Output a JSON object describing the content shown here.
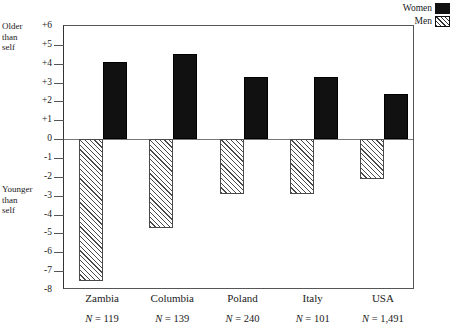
{
  "legend": {
    "items": [
      {
        "label": "Women",
        "style": "solid",
        "color": "#111111",
        "icon": "solid-swatch-icon"
      },
      {
        "label": "Men",
        "style": "hatch",
        "color": "#4a4a4a",
        "icon": "hatched-swatch-icon"
      }
    ]
  },
  "axis_captions": {
    "top": "Older\nthan\nself",
    "top_lines": [
      "Older",
      "than",
      "self"
    ],
    "bottom_lines": [
      "Younger",
      "than",
      "self"
    ]
  },
  "chart_data": {
    "type": "bar",
    "title": "",
    "xlabel": "",
    "ylabel": "",
    "ylim": [
      -8,
      6
    ],
    "grid": false,
    "legend_position": "top-right",
    "categories": [
      "Zambia",
      "Columbia",
      "Poland",
      "Italy",
      "USA"
    ],
    "sample_sizes": [
      "N = 119",
      "N = 139",
      "N = 240",
      "N = 101",
      "N = 1,491"
    ],
    "ytick_labels": [
      "+6",
      "+5",
      "+4",
      "+3",
      "+2",
      "+1",
      "0",
      "-1",
      "-2",
      "-3",
      "-4",
      "-5",
      "-6",
      "-7",
      "-8"
    ],
    "ytick_values": [
      6,
      5,
      4,
      3,
      2,
      1,
      0,
      -1,
      -2,
      -3,
      -4,
      -5,
      -6,
      -7,
      -8
    ],
    "series": [
      {
        "name": "Women",
        "values": [
          4.1,
          4.5,
          3.3,
          3.3,
          2.4
        ]
      },
      {
        "name": "Men",
        "values": [
          -7.5,
          -4.7,
          -2.9,
          -2.9,
          -2.1
        ]
      }
    ]
  }
}
